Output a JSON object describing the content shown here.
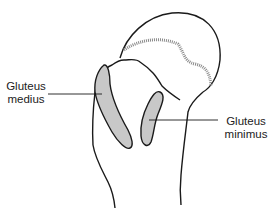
{
  "diagram": {
    "colors": {
      "outline": "#1a1a1a",
      "insertion_fill": "#c8c8c8",
      "hatching": "#8a8a8a",
      "background": "#ffffff",
      "text": "#222222"
    },
    "labels": [
      {
        "id": "gluteus-medius",
        "line1": "Gluteus",
        "line2": "medius"
      },
      {
        "id": "gluteus-minimus",
        "line1": "Gluteus",
        "line2": "minimus"
      }
    ]
  }
}
